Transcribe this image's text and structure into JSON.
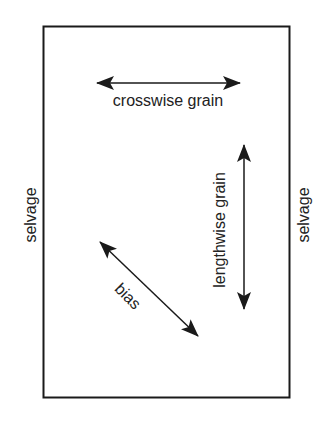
{
  "diagram": {
    "type": "fabric grain diagram",
    "labels": {
      "crosswise": "crosswise grain",
      "lengthwise": "lengthwise grain",
      "bias": "bias",
      "selvage_left": "selvage",
      "selvage_right": "selvage"
    },
    "colors": {
      "line": "#1a1a1a",
      "text": "#222222",
      "background": "#ffffff"
    }
  }
}
